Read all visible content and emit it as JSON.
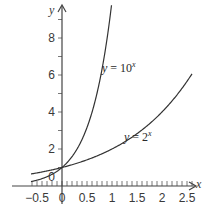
{
  "chart_data": {
    "type": "line",
    "title": "",
    "xlabel": "x",
    "ylabel": "y",
    "xlim": [
      -0.65,
      2.75
    ],
    "ylim": [
      0,
      9.8
    ],
    "grid": false,
    "legend": "inline labels",
    "x_ticks": [
      -0.5,
      0,
      0.5,
      1,
      1.5,
      2,
      2.5
    ],
    "x_tick_labels": [
      "−0.5",
      "0",
      "0.5",
      "1",
      "1.5",
      "2",
      "2.5"
    ],
    "x_minor_step": 0.1,
    "y_ticks": [
      0,
      2,
      4,
      6,
      8
    ],
    "y_tick_labels": [
      "0",
      "2",
      "4",
      "6",
      "8"
    ],
    "y_minor_step": 1,
    "series": [
      {
        "name": "y = 10^x",
        "label_base": "y = 10",
        "label_exp": "x",
        "function": "10^x",
        "x": [
          -0.6,
          -0.4,
          -0.2,
          0,
          0.2,
          0.4,
          0.6,
          0.8,
          0.95
        ],
        "values": [
          0.25,
          0.4,
          0.63,
          1,
          1.58,
          2.51,
          3.98,
          6.31,
          8.91
        ]
      },
      {
        "name": "y = 2^x",
        "label_base": "y = 2",
        "label_exp": "x",
        "function": "2^x",
        "x": [
          -0.6,
          -0.3,
          0,
          0.5,
          1,
          1.5,
          2,
          2.5
        ],
        "values": [
          0.66,
          0.81,
          1,
          1.41,
          2,
          2.83,
          4,
          5.66
        ]
      }
    ]
  }
}
